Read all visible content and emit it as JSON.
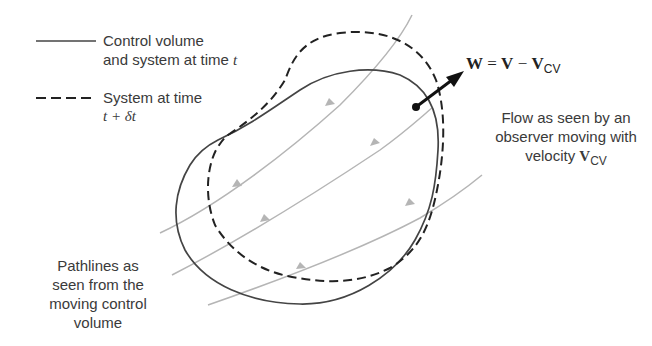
{
  "legend": {
    "solid": {
      "line1": "Control volume",
      "line2_prefix": "and system at time ",
      "line2_var": "t"
    },
    "dashed": {
      "line1": "System at time",
      "line2": "t + δt"
    }
  },
  "equation": {
    "W": "W",
    "eq": " = ",
    "V": "V",
    "minus": " − ",
    "Vcv": "V",
    "sub": "CV"
  },
  "observer_label": {
    "line1": "Flow as seen by an",
    "line2": "observer moving with",
    "line3_prefix": "velocity ",
    "line3_var": "V",
    "line3_sub": "CV"
  },
  "pathlines_label": {
    "line1": "Pathlines as",
    "line2": "seen from the",
    "line3": "moving control",
    "line4": "volume"
  },
  "colors": {
    "solid_boundary": "#444444",
    "dashed_boundary": "#222222",
    "pathlines": "#b0b0b0",
    "arrow": "#111111",
    "text": "#3a3a3a"
  }
}
